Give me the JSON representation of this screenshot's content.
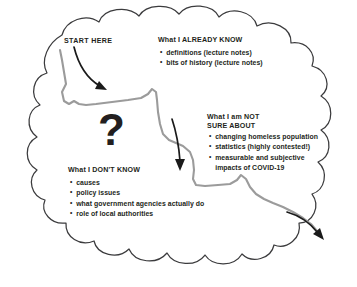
{
  "diagram": {
    "colors": {
      "cloud_outline": "#3b3b3d",
      "path_line": "#9b9b9b",
      "arrow": "#1a1a1a",
      "text": "#231f20",
      "background": "#ffffff"
    },
    "question_mark": "?",
    "start_label": "START HERE",
    "sections": [
      {
        "id": "already-know",
        "heading": "What I ALREADY KNOW",
        "bullets": [
          "definitions (lecture notes)",
          "bits of history (lecture notes)"
        ]
      },
      {
        "id": "not-sure-about",
        "heading_line1": "What I am NOT",
        "heading_line2": "SURE ABOUT",
        "bullets": [
          "changing homeless population",
          "statistics (highly contested!)",
          "measurable and subjective",
          "impacts of COVID-19"
        ]
      },
      {
        "id": "dont-know",
        "heading": "What I DON'T KNOW",
        "bullets": [
          "causes",
          "policy issues",
          "what government agencies actually do",
          "role of local authorities"
        ]
      }
    ]
  }
}
